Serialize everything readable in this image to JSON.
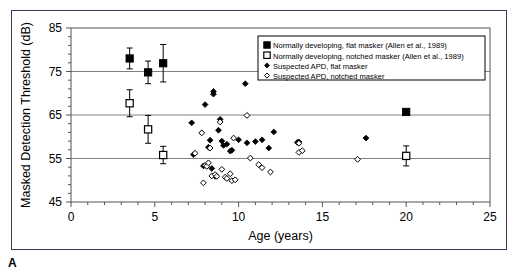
{
  "figure": {
    "panel_label": "A",
    "frame_color": "#3a3a5a",
    "background": "#ffffff"
  },
  "chart_data": {
    "type": "scatter",
    "title": "",
    "xlabel": "Age (years)",
    "ylabel": "Masked Detection Threshold (dB)",
    "xlim": [
      0,
      25
    ],
    "ylim": [
      45,
      85
    ],
    "xticks": [
      0,
      5,
      10,
      15,
      20,
      25
    ],
    "xtick_labels": [
      "0",
      "5",
      "10",
      "15",
      "20",
      "25"
    ],
    "yticks": [
      45,
      55,
      65,
      75,
      85
    ],
    "ytick_labels": [
      "45",
      "55",
      "65",
      "75",
      "85"
    ],
    "x_minor_tick_step": 1,
    "y_minor_tick_step": 2,
    "grid": "horizontal-major",
    "grid_color": "#808080",
    "legend_position": "top-right",
    "series": [
      {
        "name": "Normally developing, flat masker (Allen et al., 1989)",
        "marker": "filled-square",
        "color": "#000000",
        "has_error_bars": true,
        "points": [
          {
            "x": 3.5,
            "y": 78.0,
            "err": 2.4
          },
          {
            "x": 4.6,
            "y": 74.8,
            "err": 2.6
          },
          {
            "x": 5.5,
            "y": 76.9,
            "err": 4.3
          },
          {
            "x": 20.0,
            "y": 65.7,
            "err": 0
          }
        ]
      },
      {
        "name": "Normally developing, notched masker (Allen et al., 1989)",
        "marker": "open-square",
        "color": "#000000",
        "has_error_bars": true,
        "points": [
          {
            "x": 3.5,
            "y": 67.7,
            "err": 3.1
          },
          {
            "x": 4.6,
            "y": 61.7,
            "err": 3.2
          },
          {
            "x": 5.5,
            "y": 55.8,
            "err": 2.0
          },
          {
            "x": 20.0,
            "y": 55.6,
            "err": 2.3
          }
        ]
      },
      {
        "name": "Suspected APD, flat masker",
        "marker": "filled-diamond",
        "color": "#000000",
        "has_error_bars": false,
        "points": [
          {
            "x": 7.2,
            "y": 63.2
          },
          {
            "x": 7.3,
            "y": 55.9
          },
          {
            "x": 7.9,
            "y": 53.3
          },
          {
            "x": 8.0,
            "y": 67.4
          },
          {
            "x": 8.2,
            "y": 57.6
          },
          {
            "x": 8.3,
            "y": 59.2
          },
          {
            "x": 8.4,
            "y": 52.7
          },
          {
            "x": 8.5,
            "y": 69.8
          },
          {
            "x": 8.5,
            "y": 70.4
          },
          {
            "x": 8.6,
            "y": 50.9
          },
          {
            "x": 8.8,
            "y": 61.5
          },
          {
            "x": 8.9,
            "y": 64.0
          },
          {
            "x": 9.0,
            "y": 59.0
          },
          {
            "x": 9.1,
            "y": 58.0
          },
          {
            "x": 9.3,
            "y": 58.3
          },
          {
            "x": 9.5,
            "y": 56.7
          },
          {
            "x": 9.6,
            "y": 56.9
          },
          {
            "x": 10.0,
            "y": 59.3
          },
          {
            "x": 10.4,
            "y": 72.2
          },
          {
            "x": 10.5,
            "y": 58.6
          },
          {
            "x": 11.0,
            "y": 58.9
          },
          {
            "x": 11.4,
            "y": 59.3
          },
          {
            "x": 11.8,
            "y": 57.4
          },
          {
            "x": 12.1,
            "y": 61.1
          },
          {
            "x": 13.5,
            "y": 58.7
          },
          {
            "x": 13.6,
            "y": 58.8
          },
          {
            "x": 17.6,
            "y": 59.7
          }
        ]
      },
      {
        "name": "Suspected APD, notched masker",
        "marker": "open-diamond",
        "color": "#000000",
        "has_error_bars": false,
        "points": [
          {
            "x": 7.4,
            "y": 56.2
          },
          {
            "x": 7.8,
            "y": 60.9
          },
          {
            "x": 7.9,
            "y": 49.4
          },
          {
            "x": 8.0,
            "y": 53.4
          },
          {
            "x": 8.1,
            "y": 53.2
          },
          {
            "x": 8.2,
            "y": 54.0
          },
          {
            "x": 8.3,
            "y": 57.4
          },
          {
            "x": 8.4,
            "y": 51.0
          },
          {
            "x": 8.6,
            "y": 51.3
          },
          {
            "x": 8.7,
            "y": 50.9
          },
          {
            "x": 8.9,
            "y": 63.4
          },
          {
            "x": 9.0,
            "y": 52.5
          },
          {
            "x": 9.2,
            "y": 50.7
          },
          {
            "x": 9.3,
            "y": 50.4
          },
          {
            "x": 9.5,
            "y": 51.5
          },
          {
            "x": 9.6,
            "y": 49.9
          },
          {
            "x": 9.7,
            "y": 59.7
          },
          {
            "x": 9.8,
            "y": 50.1
          },
          {
            "x": 10.5,
            "y": 64.9
          },
          {
            "x": 10.7,
            "y": 55.1
          },
          {
            "x": 11.2,
            "y": 53.6
          },
          {
            "x": 11.4,
            "y": 52.9
          },
          {
            "x": 11.9,
            "y": 51.9
          },
          {
            "x": 13.6,
            "y": 58.5
          },
          {
            "x": 13.6,
            "y": 56.4
          },
          {
            "x": 13.8,
            "y": 56.8
          },
          {
            "x": 17.1,
            "y": 54.8
          }
        ]
      }
    ]
  }
}
